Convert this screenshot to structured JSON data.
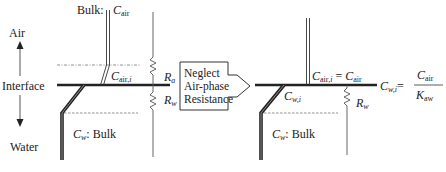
{
  "diagram": {
    "type": "two-film mass transfer schematic",
    "left_panel": {
      "side_labels": {
        "air": "Air",
        "interface": "Interface",
        "water": "Water"
      },
      "air_bulk_label": {
        "prefix": "Bulk: ",
        "symbol": "C",
        "subscript": "air"
      },
      "air_interface_label": {
        "symbol": "C",
        "subscript": "air,",
        "subscript_italic": "i"
      },
      "water_interface_label": {
        "symbol": "C",
        "subscript": "w,",
        "subscript_italic": "i"
      },
      "water_bulk_label": {
        "symbol": "C",
        "subscript": "w",
        "suffix": ": Bulk"
      },
      "resistances": [
        {
          "symbol": "R",
          "subscript": "a"
        },
        {
          "symbol": "R",
          "subscript": "w"
        }
      ]
    },
    "transition_arrow": {
      "lines": [
        "Neglect",
        "Air-phase",
        "Resistance"
      ]
    },
    "right_panel": {
      "air_interface_equation": {
        "lhs_symbol": "C",
        "lhs_subscript": "air,",
        "lhs_subscript_italic": "i",
        "operator": " = ",
        "rhs_symbol": "C",
        "rhs_subscript": "air"
      },
      "water_interface_label": {
        "symbol": "C",
        "subscript": "w,",
        "subscript_italic": "i"
      },
      "water_interface_equation": {
        "lhs_symbol": "C",
        "lhs_subscript": "w,",
        "lhs_subscript_italic": "i",
        "operator": "=",
        "numerator_symbol": "C",
        "numerator_subscript": "air",
        "denominator_symbol": "K",
        "denominator_subscript": "aw"
      },
      "water_bulk_label": {
        "symbol": "C",
        "subscript": "w",
        "suffix": ": Bulk"
      },
      "resistances": [
        {
          "symbol": "R",
          "subscript": "w"
        }
      ]
    },
    "colors": {
      "line": "#222222",
      "thin_line": "#555555",
      "dashed": "#777777"
    }
  }
}
